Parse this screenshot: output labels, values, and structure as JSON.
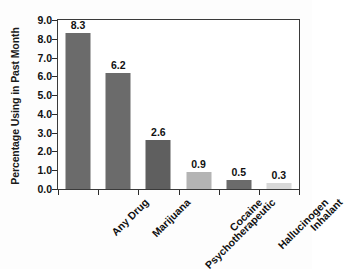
{
  "chart_data": {
    "type": "bar",
    "title": "",
    "subtitle": "",
    "xlabel": "",
    "ylabel": "Percentage Using in Past Month",
    "categories": [
      "Any Drug",
      "Marijuana",
      "Psychotherapeutic",
      "Cocaine",
      "Hallucinogen",
      "Inhalant"
    ],
    "values": [
      8.3,
      6.2,
      2.6,
      0.9,
      0.5,
      0.3
    ],
    "data_labels": [
      "8.3",
      "6.2",
      "2.6",
      "0.9",
      "0.5",
      "0.3"
    ],
    "ylim": [
      0.0,
      9.0
    ],
    "ytick_values": [
      9.0,
      8.0,
      7.0,
      6.0,
      5.0,
      4.0,
      3.0,
      2.0,
      1.0,
      0.0
    ],
    "ytick_labels": [
      "9.0",
      "8.0",
      "7.0",
      "6.0",
      "5.0",
      "4.0",
      "3.0",
      "2.0",
      "1.0",
      "0.0"
    ],
    "grid": false,
    "legend": false,
    "legend_position": "none",
    "bar_colors": [
      "#6b6b6b",
      "#6b6b6b",
      "#5f5f5f",
      "#b4b4b4",
      "#6b6b6b",
      "#d8d8d8"
    ],
    "frame_color": "#3a3a3a",
    "plot_background": "#ffffff",
    "text_color": "#111111",
    "xtick_label_rotation": -45
  }
}
